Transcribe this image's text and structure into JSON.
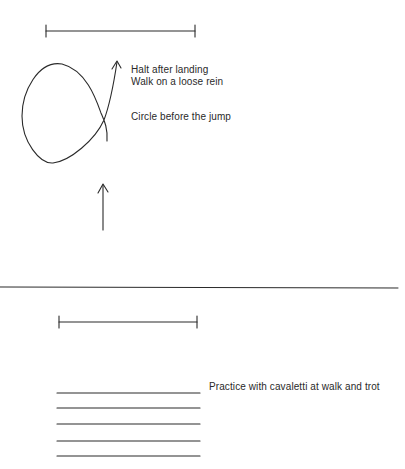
{
  "diagram": {
    "top_exercise": {
      "labels": {
        "halt": "Halt after landing",
        "walk": "Walk on a loose rein",
        "circle": "Circle before the jump"
      }
    },
    "bottom_exercise": {
      "labels": {
        "cavaletti": "Practice with cavaletti at walk and trot"
      },
      "pole_count": 5
    },
    "colors": {
      "ink": "#2a2a2a",
      "background": "#ffffff"
    }
  }
}
